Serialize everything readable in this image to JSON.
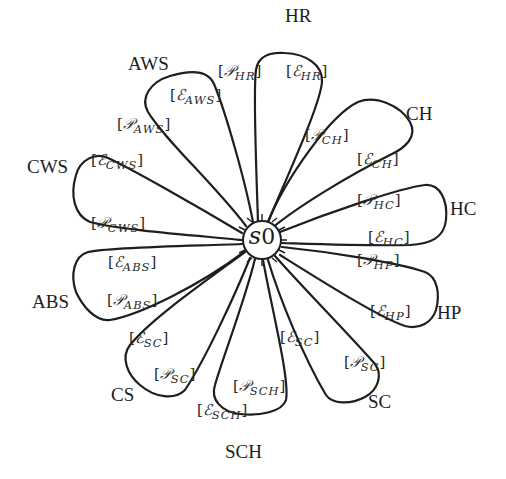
{
  "diagram": {
    "center": {
      "symbol": "s",
      "subscript": "0"
    },
    "nodes": [
      {
        "id": "HR",
        "label": "HR",
        "x": 285,
        "y": 6
      },
      {
        "id": "AWS",
        "label": "AWS",
        "x": 128,
        "y": 54
      },
      {
        "id": "CH",
        "label": "CH",
        "x": 406,
        "y": 104
      },
      {
        "id": "CWS",
        "label": "CWS",
        "x": 27,
        "y": 157
      },
      {
        "id": "HC",
        "label": "HC",
        "x": 450,
        "y": 199
      },
      {
        "id": "ABS",
        "label": "ABS",
        "x": 32,
        "y": 292
      },
      {
        "id": "HP",
        "label": "HP",
        "x": 437,
        "y": 303
      },
      {
        "id": "SC",
        "label": "SC",
        "x": 368,
        "y": 392
      },
      {
        "id": "CS",
        "label": "CS",
        "x": 111,
        "y": 385
      },
      {
        "id": "SCH",
        "label": "SCH",
        "x": 225,
        "y": 442
      }
    ],
    "edge_labels": [
      {
        "name": "p-hr",
        "open": "[",
        "symbol": "𝒫",
        "subscript": "HR",
        "close": "]",
        "x": 218,
        "y": 64
      },
      {
        "name": "e-hr",
        "open": "[",
        "symbol": "ℰ",
        "subscript": "HR",
        "close": "]",
        "x": 286,
        "y": 64
      },
      {
        "name": "e-aws",
        "open": "[",
        "symbol": "ℰ",
        "subscript": "AWS",
        "close": "]",
        "x": 170,
        "y": 88
      },
      {
        "name": "p-aws",
        "open": "[",
        "symbol": "𝒫",
        "subscript": "AWS",
        "close": "]",
        "x": 117,
        "y": 117
      },
      {
        "name": "p-ch",
        "open": "[",
        "symbol": "𝒫",
        "subscript": "CH",
        "close": "]",
        "x": 305,
        "y": 128
      },
      {
        "name": "e-ch",
        "open": "[",
        "symbol": "ℰ",
        "subscript": "CH",
        "close": "]",
        "x": 357,
        "y": 152
      },
      {
        "name": "e-cws",
        "open": "[",
        "symbol": "ℰ",
        "subscript": "CWS",
        "close": "]",
        "x": 91,
        "y": 153
      },
      {
        "name": "p-hc",
        "open": "[",
        "symbol": "𝒫",
        "subscript": "HC",
        "close": "]",
        "x": 357,
        "y": 193
      },
      {
        "name": "p-cws",
        "open": "[",
        "symbol": "𝒫",
        "subscript": "CWS",
        "close": "]",
        "x": 91,
        "y": 216
      },
      {
        "name": "e-hc",
        "open": "[",
        "symbol": "ℰ",
        "subscript": "HC",
        "close": "]",
        "x": 368,
        "y": 230
      },
      {
        "name": "e-abs",
        "open": "[",
        "symbol": "ℰ",
        "subscript": "ABS",
        "close": "]",
        "x": 108,
        "y": 255
      },
      {
        "name": "p-hp",
        "open": "[",
        "symbol": "𝒫",
        "subscript": "HP",
        "close": "]",
        "x": 357,
        "y": 253
      },
      {
        "name": "p-abs",
        "open": "[",
        "symbol": "𝒫",
        "subscript": "ABS",
        "close": "]",
        "x": 107,
        "y": 293
      },
      {
        "name": "e-hp",
        "open": "[",
        "symbol": "ℰ",
        "subscript": "HP",
        "close": "]",
        "x": 370,
        "y": 304
      },
      {
        "name": "e-sc-left",
        "open": "[",
        "symbol": "ℰ",
        "subscript": "SC",
        "close": "]",
        "x": 129,
        "y": 331
      },
      {
        "name": "e-sc-right",
        "open": "[",
        "symbol": "ℰ",
        "subscript": "SC",
        "close": "]",
        "x": 280,
        "y": 330
      },
      {
        "name": "p-sc-left",
        "open": "[",
        "symbol": "𝒫",
        "subscript": "SC",
        "close": "]",
        "x": 154,
        "y": 367
      },
      {
        "name": "p-sc-right",
        "open": "[",
        "symbol": "𝒫",
        "subscript": "SC",
        "close": "]",
        "x": 344,
        "y": 355
      },
      {
        "name": "p-sch",
        "open": "[",
        "symbol": "𝒫",
        "subscript": "SCH",
        "close": "]",
        "x": 233,
        "y": 379
      },
      {
        "name": "e-sch",
        "open": "[",
        "symbol": "ℰ",
        "subscript": "SCH",
        "close": "]",
        "x": 197,
        "y": 403
      }
    ]
  }
}
